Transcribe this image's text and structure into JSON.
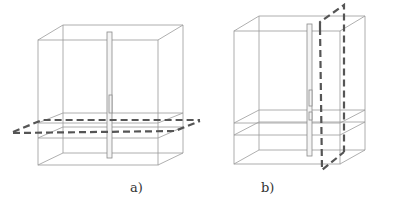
{
  "figure": {
    "panels": [
      {
        "id": "a",
        "label": "a)",
        "section_plane": "horizontal"
      },
      {
        "id": "b",
        "label": "b)",
        "section_plane": "vertical"
      }
    ],
    "colors": {
      "wireframe": "#9a9a9a",
      "section_plane": "#555555",
      "background": "#ffffff"
    }
  }
}
